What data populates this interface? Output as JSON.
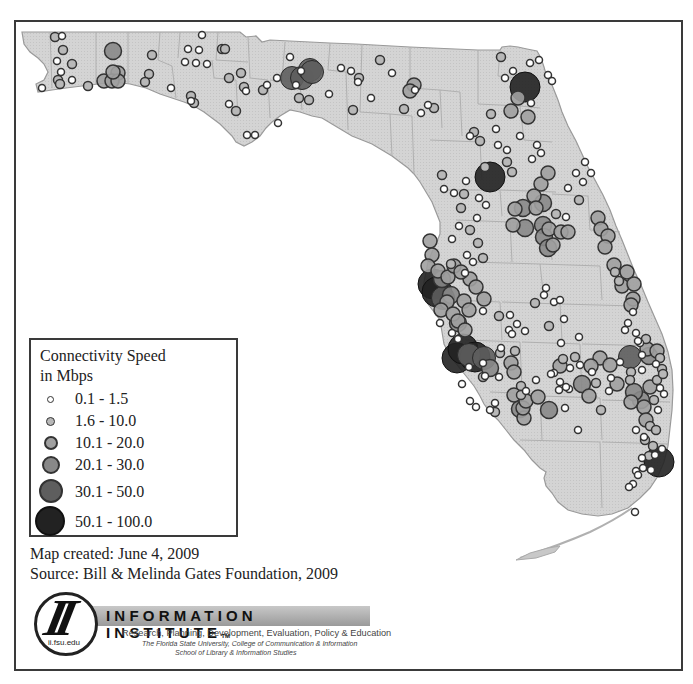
{
  "map": {
    "title": "Florida Public Library Connectivity Speed",
    "land_color": "#d4d4d4",
    "county_line_color": "#a8a8a8",
    "outline_color": "#9a9a9a"
  },
  "legend": {
    "title_line1": "Connectivity Speed",
    "title_line2": "in Mbps",
    "classes": [
      {
        "label": "0.1 - 1.5",
        "size": 7,
        "fill": "#ffffff",
        "stroke": "#333333"
      },
      {
        "label": "1.6 - 10.0",
        "size": 9,
        "fill": "#b8b8b8",
        "stroke": "#333333"
      },
      {
        "label": "10.1 - 20.0",
        "size": 14,
        "fill": "#a0a0a0",
        "stroke": "#333333"
      },
      {
        "label": "20.1 - 30.0",
        "size": 17,
        "fill": "#888888",
        "stroke": "#333333"
      },
      {
        "label": "30.1 - 50.0",
        "size": 23,
        "fill": "#5e5e5e",
        "stroke": "#2a2a2a"
      },
      {
        "label": "50.1 - 100.0",
        "size": 30,
        "fill": "#222222",
        "stroke": "#111111"
      }
    ]
  },
  "credits": {
    "created": "Map created: June 4, 2009",
    "source": "Source: Bill & Melinda Gates Foundation, 2009"
  },
  "logo": {
    "monogram": "II",
    "url": "ii.fsu.edu",
    "title": "INFORMATION INSTITUTE",
    "trademark": "TM",
    "tagline": "Research, Planning, Development, Evaluation, Policy & Education",
    "institution_line1": "The Florida State University, College of Communication & Information",
    "institution_line2": "School of Library & Information Studies"
  },
  "chart_data": {
    "type": "scatter",
    "legend_position": "lower-left inset",
    "classes": [
      "0.1 - 1.5",
      "1.6 - 10.0",
      "10.1 - 20.0",
      "20.1 - 30.0",
      "30.1 - 50.0",
      "50.1 - 100.0"
    ],
    "clusters": [
      {
        "area": "Pensacola / western panhandle",
        "dominant_class": "0.1 - 1.5"
      },
      {
        "area": "Tallahassee",
        "dominant_class": "30.1 - 50.0"
      },
      {
        "area": "Jacksonville",
        "dominant_class": "50.1 - 100.0"
      },
      {
        "area": "Gainesville / Ocala",
        "dominant_class": "50.1 - 100.0"
      },
      {
        "area": "Orlando",
        "dominant_class": "20.1 - 30.0"
      },
      {
        "area": "Tampa Bay",
        "dominant_class": "50.1 - 100.0"
      },
      {
        "area": "Sarasota / Bradenton",
        "dominant_class": "50.1 - 100.0"
      },
      {
        "area": "Southeast coast (Palm Beach to Miami)",
        "dominant_class": "1.6 - 10.0"
      }
    ]
  },
  "points": [
    [
      55,
      37,
      1
    ],
    [
      62,
      36,
      0
    ],
    [
      63,
      50,
      1
    ],
    [
      72,
      64,
      1
    ],
    [
      57,
      61,
      0
    ],
    [
      61,
      72,
      0
    ],
    [
      58,
      80,
      1
    ],
    [
      60,
      84,
      1
    ],
    [
      72,
      80,
      0
    ],
    [
      42,
      88,
      0
    ],
    [
      88,
      86,
      1
    ],
    [
      113,
      51,
      3
    ],
    [
      118,
      73,
      2
    ],
    [
      104,
      81,
      2
    ],
    [
      112,
      81,
      2
    ],
    [
      118,
      81,
      2
    ],
    [
      113,
      72,
      2
    ],
    [
      152,
      55,
      1
    ],
    [
      149,
      74,
      1
    ],
    [
      145,
      82,
      1
    ],
    [
      171,
      88,
      0
    ],
    [
      191,
      96,
      1
    ],
    [
      194,
      103,
      1
    ],
    [
      191,
      101,
      0
    ],
    [
      202,
      35,
      0
    ],
    [
      188,
      49,
      0
    ],
    [
      199,
      50,
      0
    ],
    [
      185,
      62,
      0
    ],
    [
      196,
      63,
      0
    ],
    [
      207,
      64,
      0
    ],
    [
      222,
      49,
      1
    ],
    [
      225,
      49,
      1
    ],
    [
      241,
      73,
      1
    ],
    [
      229,
      78,
      1
    ],
    [
      244,
      87,
      1
    ],
    [
      246,
      91,
      0
    ],
    [
      236,
      111,
      1
    ],
    [
      229,
      104,
      0
    ],
    [
      247,
      135,
      0
    ],
    [
      255,
      135,
      0
    ],
    [
      277,
      78,
      0
    ],
    [
      263,
      90,
      1
    ],
    [
      292,
      78,
      4
    ],
    [
      290,
      57,
      0
    ],
    [
      302,
      78,
      4
    ],
    [
      310,
      70,
      4
    ],
    [
      312,
      72,
      4
    ],
    [
      301,
      71,
      0
    ],
    [
      296,
      85,
      0
    ],
    [
      309,
      100,
      1
    ],
    [
      278,
      123,
      0
    ],
    [
      299,
      98,
      1
    ],
    [
      267,
      85,
      0
    ],
    [
      329,
      94,
      0
    ],
    [
      341,
      68,
      0
    ],
    [
      351,
      71,
      0
    ],
    [
      359,
      78,
      1
    ],
    [
      358,
      82,
      0
    ],
    [
      353,
      110,
      1
    ],
    [
      371,
      98,
      0
    ],
    [
      380,
      60,
      1
    ],
    [
      392,
      73,
      0
    ],
    [
      414,
      85,
      2
    ],
    [
      410,
      91,
      2
    ],
    [
      415,
      90,
      0
    ],
    [
      404,
      109,
      1
    ],
    [
      421,
      113,
      0
    ],
    [
      428,
      105,
      0
    ],
    [
      434,
      108,
      1
    ],
    [
      501,
      57,
      1
    ],
    [
      513,
      71,
      0
    ],
    [
      505,
      78,
      0
    ],
    [
      530,
      63,
      0
    ],
    [
      539,
      60,
      0
    ],
    [
      525,
      87,
      5
    ],
    [
      518,
      98,
      2
    ],
    [
      548,
      75,
      0
    ],
    [
      552,
      81,
      0
    ],
    [
      511,
      111,
      2
    ],
    [
      528,
      117,
      2
    ],
    [
      531,
      103,
      0
    ],
    [
      496,
      129,
      0
    ],
    [
      491,
      114,
      1
    ],
    [
      470,
      136,
      0
    ],
    [
      474,
      132,
      1
    ],
    [
      480,
      141,
      1
    ],
    [
      498,
      145,
      0
    ],
    [
      485,
      167,
      1
    ],
    [
      490,
      177,
      5
    ],
    [
      507,
      150,
      0
    ],
    [
      520,
      136,
      0
    ],
    [
      512,
      172,
      1
    ],
    [
      537,
      145,
      0
    ],
    [
      541,
      153,
      0
    ],
    [
      532,
      159,
      0
    ],
    [
      507,
      162,
      1
    ],
    [
      541,
      184,
      2
    ],
    [
      548,
      173,
      2
    ],
    [
      534,
      196,
      2
    ],
    [
      536,
      208,
      2
    ],
    [
      543,
      203,
      3
    ],
    [
      523,
      208,
      3
    ],
    [
      515,
      209,
      2
    ],
    [
      513,
      225,
      2
    ],
    [
      525,
      228,
      3
    ],
    [
      543,
      225,
      3
    ],
    [
      544,
      237,
      3
    ],
    [
      549,
      229,
      2
    ],
    [
      548,
      248,
      3
    ],
    [
      553,
      245,
      2
    ],
    [
      561,
      232,
      2
    ],
    [
      568,
      232,
      2
    ],
    [
      556,
      214,
      1
    ],
    [
      566,
      217,
      0
    ],
    [
      576,
      173,
      0
    ],
    [
      583,
      182,
      0
    ],
    [
      579,
      200,
      1
    ],
    [
      598,
      218,
      2
    ],
    [
      601,
      229,
      2
    ],
    [
      608,
      236,
      2
    ],
    [
      605,
      247,
      2
    ],
    [
      614,
      265,
      2
    ],
    [
      615,
      272,
      1
    ],
    [
      627,
      272,
      2
    ],
    [
      622,
      286,
      2
    ],
    [
      634,
      284,
      2
    ],
    [
      633,
      299,
      2
    ],
    [
      631,
      305,
      2
    ],
    [
      619,
      281,
      1
    ],
    [
      568,
      188,
      0
    ],
    [
      591,
      173,
      0
    ],
    [
      585,
      162,
      0
    ],
    [
      442,
      175,
      1
    ],
    [
      444,
      189,
      0
    ],
    [
      454,
      193,
      0
    ],
    [
      466,
      181,
      0
    ],
    [
      464,
      194,
      1
    ],
    [
      479,
      198,
      0
    ],
    [
      486,
      205,
      0
    ],
    [
      461,
      208,
      1
    ],
    [
      477,
      218,
      0
    ],
    [
      470,
      230,
      1
    ],
    [
      478,
      243,
      1
    ],
    [
      483,
      258,
      1
    ],
    [
      467,
      255,
      0
    ],
    [
      473,
      262,
      0
    ],
    [
      451,
      264,
      1
    ],
    [
      465,
      273,
      0
    ],
    [
      470,
      279,
      2
    ],
    [
      476,
      287,
      2
    ],
    [
      484,
      299,
      2
    ],
    [
      499,
      316,
      1
    ],
    [
      510,
      315,
      0
    ],
    [
      517,
      324,
      0
    ],
    [
      525,
      331,
      0
    ],
    [
      515,
      351,
      1
    ],
    [
      483,
      311,
      0
    ],
    [
      452,
      239,
      0
    ],
    [
      459,
      226,
      0
    ],
    [
      430,
      241,
      2
    ],
    [
      432,
      255,
      2
    ],
    [
      428,
      266,
      2
    ],
    [
      438,
      271,
      2
    ],
    [
      442,
      279,
      3
    ],
    [
      448,
      277,
      2
    ],
    [
      454,
      266,
      2
    ],
    [
      461,
      272,
      2
    ],
    [
      451,
      295,
      3
    ],
    [
      447,
      302,
      2
    ],
    [
      441,
      310,
      2
    ],
    [
      433,
      284,
      5
    ],
    [
      437,
      292,
      5
    ],
    [
      443,
      298,
      4
    ],
    [
      453,
      314,
      2
    ],
    [
      458,
      321,
      2
    ],
    [
      464,
      301,
      2
    ],
    [
      469,
      310,
      2
    ],
    [
      458,
      323,
      3
    ],
    [
      465,
      330,
      2
    ],
    [
      440,
      323,
      0
    ],
    [
      452,
      333,
      0
    ],
    [
      458,
      339,
      0
    ],
    [
      457,
      358,
      5
    ],
    [
      463,
      349,
      5
    ],
    [
      469,
      355,
      4
    ],
    [
      475,
      357,
      5
    ],
    [
      484,
      358,
      4
    ],
    [
      490,
      368,
      3
    ],
    [
      469,
      367,
      0
    ],
    [
      483,
      363,
      0
    ],
    [
      485,
      376,
      0
    ],
    [
      501,
      348,
      0
    ],
    [
      509,
      330,
      0
    ],
    [
      512,
      334,
      0
    ],
    [
      546,
      288,
      0
    ],
    [
      544,
      295,
      0
    ],
    [
      554,
      302,
      0
    ],
    [
      560,
      300,
      0
    ],
    [
      564,
      319,
      0
    ],
    [
      561,
      343,
      0
    ],
    [
      563,
      359,
      1
    ],
    [
      569,
      389,
      0
    ],
    [
      580,
      365,
      0
    ],
    [
      554,
      373,
      0
    ],
    [
      560,
      382,
      0
    ],
    [
      566,
      387,
      0
    ],
    [
      570,
      368,
      0
    ],
    [
      559,
      390,
      0
    ],
    [
      500,
      353,
      1
    ],
    [
      511,
      363,
      2
    ],
    [
      514,
      372,
      2
    ],
    [
      521,
      386,
      1
    ],
    [
      521,
      395,
      1
    ],
    [
      526,
      391,
      0
    ],
    [
      514,
      395,
      2
    ],
    [
      520,
      409,
      3
    ],
    [
      524,
      418,
      2
    ],
    [
      523,
      408,
      2
    ],
    [
      526,
      401,
      2
    ],
    [
      536,
      380,
      0
    ],
    [
      538,
      397,
      2
    ],
    [
      495,
      403,
      0
    ],
    [
      490,
      410,
      0
    ],
    [
      495,
      412,
      1
    ],
    [
      476,
      407,
      0
    ],
    [
      470,
      401,
      0
    ],
    [
      462,
      384,
      0
    ],
    [
      483,
      377,
      1
    ],
    [
      535,
      303,
      1
    ],
    [
      551,
      374,
      0
    ],
    [
      560,
      366,
      2
    ],
    [
      575,
      357,
      1
    ],
    [
      592,
      372,
      0
    ],
    [
      549,
      410,
      3
    ],
    [
      565,
      408,
      0
    ],
    [
      600,
      358,
      2
    ],
    [
      610,
      365,
      2
    ],
    [
      620,
      362,
      0
    ],
    [
      631,
      372,
      1
    ],
    [
      649,
      356,
      3
    ],
    [
      647,
      349,
      2
    ],
    [
      646,
      339,
      1
    ],
    [
      657,
      351,
      2
    ],
    [
      660,
      358,
      1
    ],
    [
      662,
      369,
      1
    ],
    [
      657,
      380,
      1
    ],
    [
      650,
      387,
      2
    ],
    [
      654,
      400,
      1
    ],
    [
      641,
      400,
      3
    ],
    [
      644,
      407,
      2
    ],
    [
      660,
      388,
      0
    ],
    [
      664,
      394,
      0
    ],
    [
      658,
      410,
      0
    ],
    [
      646,
      420,
      2
    ],
    [
      650,
      426,
      1
    ],
    [
      656,
      430,
      1
    ],
    [
      645,
      440,
      1
    ],
    [
      653,
      446,
      1
    ],
    [
      662,
      449,
      0
    ],
    [
      655,
      455,
      0
    ],
    [
      649,
      456,
      1
    ],
    [
      659,
      462,
      5
    ],
    [
      643,
      468,
      0
    ],
    [
      651,
      470,
      0
    ],
    [
      642,
      458,
      0
    ],
    [
      636,
      471,
      0
    ],
    [
      638,
      475,
      0
    ],
    [
      633,
      484,
      0
    ],
    [
      629,
      487,
      0
    ],
    [
      644,
      437,
      0
    ],
    [
      636,
      430,
      0
    ],
    [
      631,
      402,
      2
    ],
    [
      634,
      392,
      3
    ],
    [
      630,
      380,
      1
    ],
    [
      617,
      384,
      2
    ],
    [
      642,
      370,
      0
    ],
    [
      656,
      364,
      0
    ],
    [
      663,
      374,
      1
    ],
    [
      640,
      343,
      0
    ],
    [
      642,
      355,
      0
    ],
    [
      636,
      333,
      0
    ],
    [
      633,
      312,
      0
    ],
    [
      625,
      330,
      0
    ],
    [
      628,
      323,
      0
    ],
    [
      609,
      391,
      0
    ],
    [
      601,
      410,
      1
    ],
    [
      596,
      383,
      1
    ],
    [
      582,
      384,
      3
    ],
    [
      589,
      396,
      2
    ],
    [
      578,
      430,
      0
    ],
    [
      635,
      512,
      0
    ],
    [
      499,
      377,
      0
    ],
    [
      549,
      326,
      1
    ],
    [
      579,
      337,
      0
    ],
    [
      638,
      341,
      0
    ],
    [
      630,
      357,
      4
    ],
    [
      591,
      366,
      2
    ],
    [
      611,
      378,
      0
    ]
  ]
}
